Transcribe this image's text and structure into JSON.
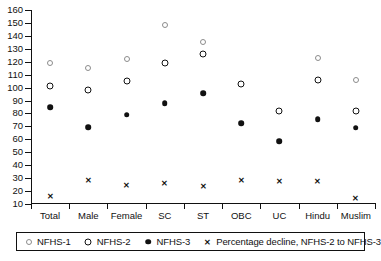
{
  "chart_data": {
    "type": "scatter",
    "title": "",
    "xlabel": "",
    "ylabel": "",
    "ylim": [
      10,
      160
    ],
    "ytick_step": 10,
    "grid": false,
    "legend_position": "bottom",
    "categories": [
      "Total",
      "Male",
      "Female",
      "SC",
      "ST",
      "OBC",
      "UC",
      "Hindu",
      "Muslim"
    ],
    "yticks": [
      160,
      150,
      140,
      130,
      120,
      110,
      100,
      90,
      80,
      70,
      60,
      50,
      40,
      30,
      20,
      10
    ],
    "series": [
      {
        "name": "NFHS-1",
        "marker": "open-circle-light",
        "values": [
          119,
          115.5,
          122,
          148.5,
          135,
          null,
          null,
          123,
          105.5
        ]
      },
      {
        "name": "NFHS-2",
        "marker": "open-circle-bold",
        "values": [
          101,
          98,
          105,
          119,
          126,
          102.5,
          82,
          106,
          82
        ]
      },
      {
        "name": "NFHS-3",
        "marker": "filled-circle",
        "values": [
          85,
          69.5,
          79,
          88,
          95.5,
          72.5,
          58.5,
          75.5,
          69
        ]
      },
      {
        "name": "Percentage decline, NFHS-2 to NFHS-3",
        "marker": "x-cross",
        "values": [
          16,
          28.5,
          24.5,
          26,
          24,
          28.5,
          27.5,
          28,
          14.5
        ]
      }
    ]
  },
  "legend": {
    "items": [
      {
        "label": "NFHS-1",
        "symbol": "open-circle-light-icon"
      },
      {
        "label": "NFHS-2",
        "symbol": "open-circle-bold-icon"
      },
      {
        "label": "NFHS-3",
        "symbol": "filled-circle-icon"
      },
      {
        "label": "Percentage decline, NFHS-2 to NFHS-3",
        "symbol": "x-cross-icon"
      }
    ]
  },
  "colors": {
    "axis": "#111111",
    "nfhs1": "#8c8c8c",
    "nfhs2": "#111111",
    "nfhs3": "#111111",
    "decline": "#111111",
    "background": "#ffffff"
  }
}
